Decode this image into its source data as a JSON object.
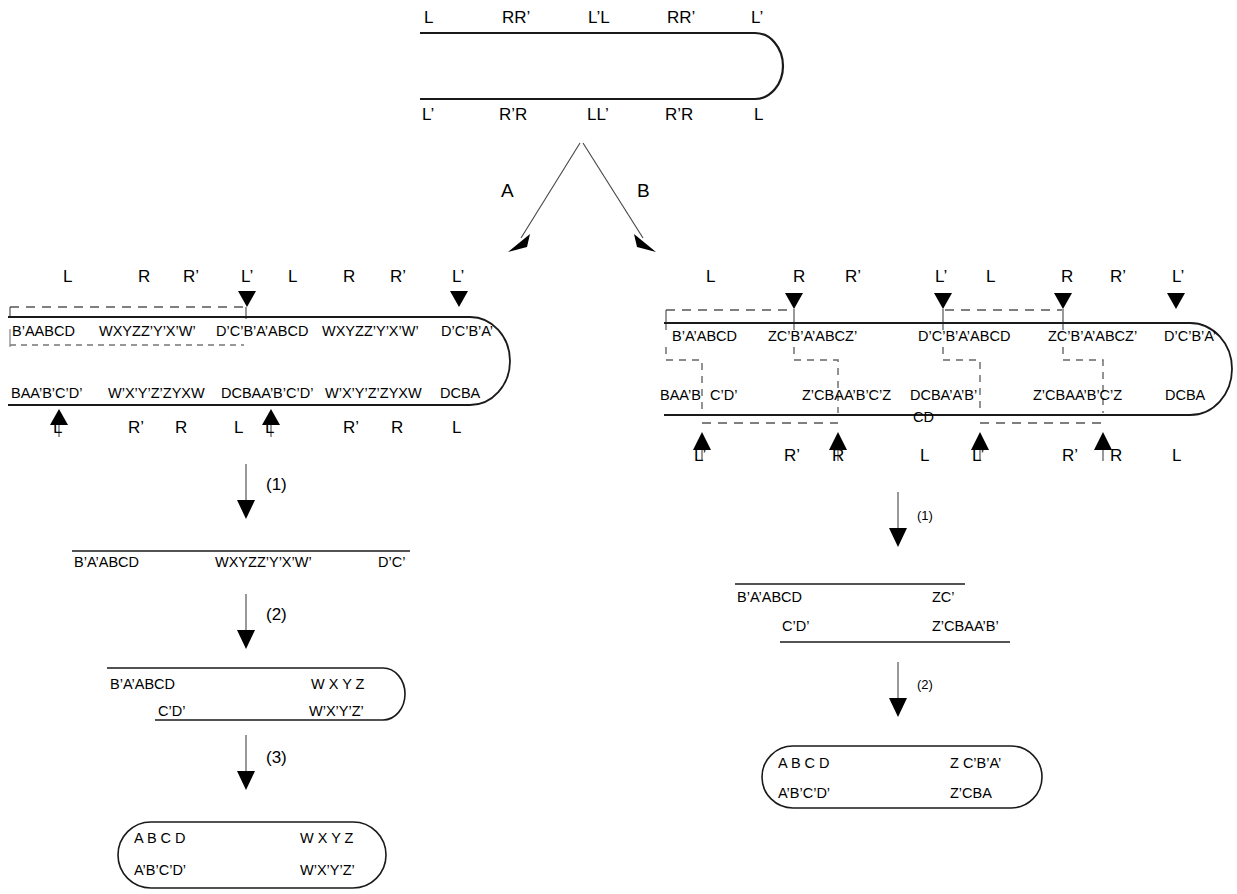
{
  "figure": {
    "title": "",
    "branch_labels": {
      "left": "A",
      "right": "B"
    }
  },
  "top_construct": {
    "name": "hairpin-top",
    "top_labels": [
      "L",
      "RR’",
      "L’L",
      "RR’",
      "L’"
    ],
    "bottom_labels": [
      "L’",
      "R’R",
      "LL’",
      "R’R",
      "L"
    ]
  },
  "left_panel": {
    "top_labels": [
      "L",
      "R",
      "R’",
      "L’",
      "L",
      "R",
      "R’",
      "L’"
    ],
    "top_strand": [
      "B’AABCD",
      "WXYZZ’Y’X’W’",
      "D’C’B’A’ABCD",
      "WXYZZ’Y’X’W’",
      "D’C’B’A’"
    ],
    "bottom_strand": [
      "BAA’B’C’D’",
      "W’X’Y’Z’ZYXW",
      "DCBAA’B’C’D’",
      "W’X’Y’Z’ZYXW",
      "DCBA"
    ],
    "bottom_labels": [
      "L’",
      "R’",
      "R",
      "L",
      "L’",
      "R’",
      "R",
      "L"
    ],
    "step1": {
      "label": "(1)",
      "top_strand": [
        "B’A’ABCD",
        "WXYZZ’Y’X’W’",
        "D’C’"
      ]
    },
    "step2": {
      "label": "(2)",
      "top_strand": [
        "B’A’ABCD",
        "W X Y Z"
      ],
      "bottom_strand": [
        "C’D’",
        "W’X’Y’Z’"
      ]
    },
    "step3": {
      "label": "(3)",
      "top_strand": [
        "A B C D",
        "W X Y Z"
      ],
      "bottom_strand": [
        "A’B’C’D’",
        "W’X’Y’Z’"
      ]
    }
  },
  "right_panel": {
    "top_labels": [
      "L",
      "R",
      "R’",
      "L’",
      "L",
      "R",
      "R’",
      "L’"
    ],
    "top_strand": [
      "B’A’ABCD",
      "ZC’B’A’ABCZ’",
      "D’C’B’A’ABCD",
      "ZC’B’A’ABCZ’",
      "D’C’B’A’"
    ],
    "bottom_strand": [
      "BAA’B",
      "C’D’",
      "Z’CBAA’B’C’Z",
      "DCBA’A’B’",
      "Z’CBAA’B’C’Z",
      "DCBA"
    ],
    "bottom_extra": "CD",
    "bottom_labels": [
      "L’",
      "R’",
      "R",
      "L",
      "L’",
      "R’",
      "R",
      "L"
    ],
    "step1": {
      "label": "(1)",
      "top_strand": [
        "B’A’ABCD",
        "ZC’"
      ],
      "bottom_strand": [
        "C’D’",
        "Z’CBAA’B’"
      ]
    },
    "step2": {
      "label": "(2)",
      "top_strand": [
        "A B C D",
        "Z C’B’A’"
      ],
      "bottom_strand": [
        "A’B’C’D’",
        "Z’CBA"
      ]
    }
  },
  "colors": {
    "stroke": "#1a1a1a",
    "dashed": "#555555",
    "background": "#ffffff",
    "text": "#000000"
  }
}
